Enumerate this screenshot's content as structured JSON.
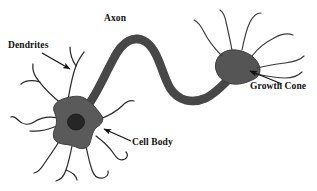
{
  "figure": {
    "background_color": "#ffffff",
    "ink_color": "#1a1a1a",
    "soma_fill": "#5a5a5a",
    "nucleus_fill": "#262626",
    "axon_fill": "#4f4f4f",
    "growth_cone_fill": "#555555"
  },
  "labels": {
    "dendrites": "Dendrites",
    "axon": "Axon",
    "growth_cone": "Growth Cone",
    "cell_body": "Cell Body"
  },
  "annotations": {
    "dendrites_arrow": "arrow pointing down-right to dendrite branch",
    "axon_arrow": "none",
    "growth_cone_arrow": "arrow pointing up-left to growth cone",
    "cell_body_arrow": "arrow pointing up-left to soma"
  },
  "parts": [
    {
      "name": "dendrites",
      "label": "Dendrites",
      "count": 9
    },
    {
      "name": "cell-body",
      "label": "Cell Body",
      "count": 1
    },
    {
      "name": "nucleus",
      "label": "Nucleus",
      "count": 1
    },
    {
      "name": "axon",
      "label": "Axon",
      "count": 1
    },
    {
      "name": "growth-cone",
      "label": "Growth Cone",
      "count": 1
    },
    {
      "name": "filopodia",
      "label": "Filopodia",
      "count": 5
    }
  ]
}
